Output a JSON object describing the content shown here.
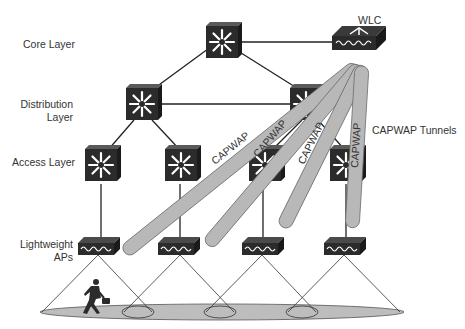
{
  "diagram": {
    "layers": [
      {
        "id": "core",
        "label": "Core Layer"
      },
      {
        "id": "distribution",
        "label_line1": "Distribution",
        "label_line2": "Layer"
      },
      {
        "id": "access",
        "label": "Access Layer"
      },
      {
        "id": "aps",
        "label_line1": "Lightweight",
        "label_line2": "APs"
      }
    ],
    "wlc": {
      "label": "WLC"
    },
    "tunnels": {
      "legend": "CAPWAP Tunnels",
      "labels": [
        "CAPWAP",
        "CAPWAP",
        "CAPWAP",
        "CAPWAP"
      ]
    },
    "nodes": {
      "core_switches": 1,
      "distribution_switches": 2,
      "access_switches": 4,
      "access_points": 4
    },
    "colors": {
      "device": "#2b2b2b",
      "tunnel": "#b8b8b8",
      "tunnel_edge": "#6e6e6e",
      "coverage": "#bdbdbd",
      "line": "#222222"
    }
  }
}
